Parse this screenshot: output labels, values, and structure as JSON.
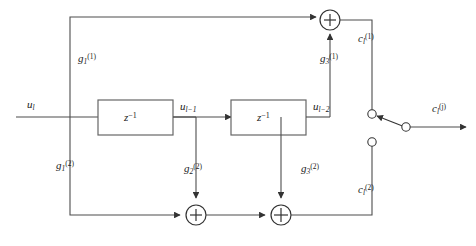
{
  "figure": {
    "type": "block-diagram"
  },
  "signals": {
    "input": {
      "base": "u",
      "sub": "l",
      "sup": ""
    },
    "tap1": {
      "base": "u",
      "sub": "l−1",
      "sup": ""
    },
    "tap2": {
      "base": "u",
      "sub": "l−2",
      "sup": ""
    },
    "output": {
      "base": "c",
      "sub": "l",
      "sup": "(j)"
    },
    "branch1": {
      "base": "c",
      "sub": "l",
      "sup": "(1)"
    },
    "branch2": {
      "base": "c",
      "sub": "l",
      "sup": "(2)"
    }
  },
  "gains": {
    "g1_1": {
      "base": "g",
      "sub": "1",
      "sup": "(1)"
    },
    "g3_1": {
      "base": "g",
      "sub": "3",
      "sup": "(1)"
    },
    "g1_2": {
      "base": "g",
      "sub": "1",
      "sup": "(2)"
    },
    "g2_2": {
      "base": "g",
      "sub": "2",
      "sup": "(2)"
    },
    "g3_2": {
      "base": "g",
      "sub": "3",
      "sup": "(2)"
    }
  },
  "blocks": {
    "delay1": {
      "label": "z",
      "exp": "−1"
    },
    "delay2": {
      "label": "z",
      "exp": "−1"
    }
  },
  "adders": {
    "top": "+",
    "bottom_left": "+",
    "bottom_right": "+"
  },
  "colors": {
    "line": "#4d4d4d",
    "text": "#1a1a1a",
    "background": "#ffffff",
    "block_border": "#666666"
  }
}
